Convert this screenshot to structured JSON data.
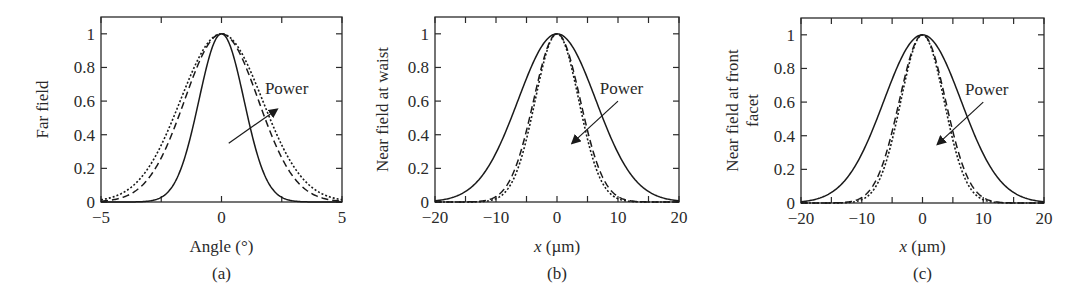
{
  "chart_data": [
    {
      "type": "line",
      "panel_label": "(a)",
      "title": "",
      "xlabel": "Angle (°)",
      "ylabel": "Far field",
      "xlim": [
        -5,
        5
      ],
      "ylim": [
        0,
        1.1
      ],
      "xticks": [
        -5,
        0,
        5
      ],
      "xtick_labels": [
        "−5",
        "0",
        "5"
      ],
      "yticks": [
        0,
        0.2,
        0.4,
        0.6,
        0.8,
        1
      ],
      "ytick_labels": [
        "0",
        "0.2",
        "0.4",
        "0.6",
        "0.8",
        "1"
      ],
      "grid": false,
      "annotation": {
        "text": "Power",
        "arrow_from": [
          0.3,
          0.35
        ],
        "arrow_to": [
          2.3,
          0.55
        ]
      },
      "series": [
        {
          "name": "low power",
          "style": "solid",
          "gaussian_hwhm": 1.1,
          "x": [
            -5,
            -4,
            -3,
            -2,
            -1.5,
            -1,
            -0.5,
            0,
            0.5,
            1,
            1.5,
            2,
            3,
            4,
            5
          ],
          "values": [
            0.0,
            0.0,
            0.0,
            0.06,
            0.21,
            0.56,
            0.87,
            1.0,
            0.87,
            0.56,
            0.21,
            0.06,
            0.0,
            0.0,
            0.0
          ]
        },
        {
          "name": "medium power",
          "style": "dashed",
          "gaussian_hwhm": 1.8,
          "x": [
            -5,
            -4,
            -3,
            -2,
            -1.5,
            -1,
            -0.5,
            0,
            0.5,
            1,
            1.5,
            2,
            3,
            4,
            5
          ],
          "values": [
            0.0,
            0.02,
            0.15,
            0.43,
            0.62,
            0.81,
            0.95,
            1.0,
            0.95,
            0.81,
            0.62,
            0.43,
            0.15,
            0.02,
            0.0
          ]
        },
        {
          "name": "high power",
          "style": "dotted",
          "gaussian_hwhm": 2.0,
          "x": [
            -5,
            -4,
            -3,
            -2,
            -1.5,
            -1,
            -0.5,
            0,
            0.5,
            1,
            1.5,
            2,
            3,
            4,
            5
          ],
          "values": [
            0.01,
            0.06,
            0.21,
            0.5,
            0.68,
            0.84,
            0.96,
            1.0,
            0.96,
            0.84,
            0.68,
            0.5,
            0.21,
            0.06,
            0.01
          ]
        }
      ]
    },
    {
      "type": "line",
      "panel_label": "(b)",
      "title": "",
      "xlabel": "x (µm)",
      "ylabel": "Near field at waist",
      "xlim": [
        -20,
        20
      ],
      "ylim": [
        0,
        1.1
      ],
      "xticks": [
        -20,
        -10,
        0,
        10,
        20
      ],
      "xtick_labels": [
        "−20",
        "−10",
        "0",
        "10",
        "20"
      ],
      "yticks": [
        0,
        0.2,
        0.4,
        0.6,
        0.8,
        1
      ],
      "ytick_labels": [
        "0",
        "0.2",
        "0.4",
        "0.6",
        "0.8",
        "1"
      ],
      "grid": false,
      "annotation": {
        "text": "Power",
        "arrow_from": [
          10,
          0.6
        ],
        "arrow_to": [
          2.5,
          0.35
        ]
      },
      "series": [
        {
          "name": "low power",
          "style": "solid",
          "gaussian_hwhm": 7.5,
          "x": [
            -20,
            -15,
            -10,
            -7.5,
            -5,
            -2.5,
            0,
            2.5,
            5,
            7.5,
            10,
            15,
            20
          ],
          "values": [
            0.0,
            0.06,
            0.29,
            0.5,
            0.73,
            0.92,
            1.0,
            0.92,
            0.73,
            0.5,
            0.29,
            0.06,
            0.0
          ]
        },
        {
          "name": "medium power",
          "style": "dashed",
          "gaussian_hwhm": 4.5,
          "x": [
            -20,
            -15,
            -10,
            -7.5,
            -5,
            -2.5,
            0,
            2.5,
            5,
            7.5,
            10,
            15,
            20
          ],
          "values": [
            0.0,
            0.0,
            0.02,
            0.15,
            0.43,
            0.81,
            1.0,
            0.81,
            0.43,
            0.15,
            0.02,
            0.0,
            0.0
          ]
        },
        {
          "name": "high power",
          "style": "dotted",
          "gaussian_hwhm": 4.2,
          "x": [
            -20,
            -15,
            -10,
            -7.5,
            -5,
            -2.5,
            0,
            2.5,
            5,
            7.5,
            10,
            15,
            20
          ],
          "values": [
            0.0,
            0.0,
            0.01,
            0.11,
            0.37,
            0.78,
            1.0,
            0.78,
            0.37,
            0.11,
            0.01,
            0.0,
            0.0
          ]
        }
      ]
    },
    {
      "type": "line",
      "panel_label": "(c)",
      "title": "",
      "xlabel": "x (µm)",
      "ylabel": "Near field at front facet",
      "ylabel_lines": [
        "Near field at front",
        "facet"
      ],
      "xlim": [
        -20,
        20
      ],
      "ylim": [
        0,
        1.1
      ],
      "xticks": [
        -20,
        -10,
        0,
        10,
        20
      ],
      "xtick_labels": [
        "−20",
        "−10",
        "0",
        "10",
        "20"
      ],
      "yticks": [
        0,
        0.2,
        0.4,
        0.6,
        0.8,
        1
      ],
      "ytick_labels": [
        "0",
        "0.2",
        "0.4",
        "0.6",
        "0.8",
        "1"
      ],
      "grid": false,
      "annotation": {
        "text": "Power",
        "arrow_from": [
          10,
          0.6
        ],
        "arrow_to": [
          2.5,
          0.35
        ]
      },
      "series": [
        {
          "name": "low power",
          "style": "solid",
          "gaussian_hwhm": 7.5,
          "x": [
            -20,
            -15,
            -10,
            -7.5,
            -5,
            -2.5,
            0,
            2.5,
            5,
            7.5,
            10,
            15,
            20
          ],
          "values": [
            0.0,
            0.06,
            0.29,
            0.5,
            0.73,
            0.92,
            1.0,
            0.92,
            0.73,
            0.5,
            0.29,
            0.06,
            0.0
          ]
        },
        {
          "name": "medium power",
          "style": "dashed",
          "gaussian_hwhm": 4.5,
          "x": [
            -20,
            -15,
            -10,
            -7.5,
            -5,
            -2.5,
            0,
            2.5,
            5,
            7.5,
            10,
            15,
            20
          ],
          "values": [
            0.0,
            0.0,
            0.02,
            0.15,
            0.43,
            0.81,
            1.0,
            0.81,
            0.43,
            0.15,
            0.02,
            0.0,
            0.0
          ]
        },
        {
          "name": "high power",
          "style": "dotted",
          "gaussian_hwhm": 4.2,
          "x": [
            -20,
            -15,
            -10,
            -7.5,
            -5,
            -2.5,
            0,
            2.5,
            5,
            7.5,
            10,
            15,
            20
          ],
          "values": [
            0.0,
            0.0,
            0.01,
            0.11,
            0.37,
            0.78,
            1.0,
            0.78,
            0.37,
            0.11,
            0.01,
            0.0,
            0.0
          ]
        }
      ]
    }
  ]
}
